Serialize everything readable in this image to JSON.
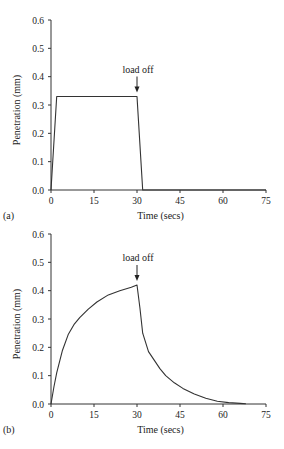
{
  "chart_data": [
    {
      "panel": "(a)",
      "type": "line",
      "title": "",
      "xlabel": "Time (secs)",
      "ylabel": "Penetration (mm)",
      "xlim": [
        0,
        75
      ],
      "ylim": [
        0,
        0.6
      ],
      "xticks": [
        "0",
        "15",
        "30",
        "45",
        "60",
        "75"
      ],
      "yticks": [
        "0.0",
        "0.1",
        "0.2",
        "0.3",
        "0.4",
        "0.5",
        "0.6"
      ],
      "grid": false,
      "annotation": {
        "text": "load off",
        "x": 30
      },
      "series": [
        {
          "name": "penetration",
          "x": [
            0,
            2,
            30,
            32,
            75
          ],
          "y": [
            0,
            0.33,
            0.33,
            0,
            0
          ]
        }
      ]
    },
    {
      "panel": "(b)",
      "type": "line",
      "title": "",
      "xlabel": "Time (secs)",
      "ylabel": "Penetration (mm)",
      "xlim": [
        0,
        75
      ],
      "ylim": [
        0,
        0.6
      ],
      "xticks": [
        "0",
        "15",
        "30",
        "45",
        "60",
        "75"
      ],
      "yticks": [
        "0.0",
        "0.1",
        "0.2",
        "0.3",
        "0.4",
        "0.5",
        "0.6"
      ],
      "grid": false,
      "annotation": {
        "text": "load off",
        "x": 30
      },
      "series": [
        {
          "name": "penetration",
          "x": [
            0,
            1,
            2,
            4,
            6,
            8,
            10,
            13,
            16,
            20,
            24,
            28,
            30,
            31,
            32,
            34,
            36,
            38,
            40,
            43,
            46,
            50,
            54,
            58,
            62,
            66,
            68
          ],
          "y": [
            0,
            0.06,
            0.11,
            0.19,
            0.245,
            0.28,
            0.305,
            0.335,
            0.36,
            0.385,
            0.4,
            0.412,
            0.42,
            0.34,
            0.25,
            0.185,
            0.155,
            0.125,
            0.1,
            0.075,
            0.055,
            0.035,
            0.02,
            0.01,
            0.005,
            0.002,
            0.001
          ]
        }
      ]
    }
  ]
}
